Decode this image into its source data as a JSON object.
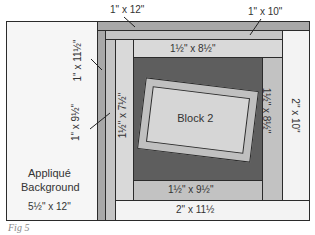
{
  "figure": {
    "caption": "Fig 5",
    "pieces": {
      "applique_background": {
        "name": "Appliqué",
        "name2": "Background",
        "size": "5½\" x 12\"",
        "color": "#f6f6f6"
      },
      "strip_1x12": {
        "size": "1\" x 12\"",
        "color": "#a8a8a8"
      },
      "strip_1x11_5": {
        "size": "1\" x 11½\"",
        "color": "#a8a8a8"
      },
      "strip_1x10": {
        "size": "1\" x 10\"",
        "color": "#c4c4c4"
      },
      "strip_1x9_5": {
        "size": "1\" x 9½\"",
        "color": "#c4c4c4"
      },
      "strip_2x10": {
        "size": "2\" x 10\"",
        "color": "#f3f3f3"
      },
      "strip_2x11_5": {
        "size": "2\" x 11½",
        "color": "#f3f3f3"
      },
      "strip_1_5x7_5": {
        "size": "1½\" x 7½\"",
        "color": "#d9d9d9"
      },
      "strip_1_5x8_5_top": {
        "size": "1½\" x 8½\"",
        "color": "#d9d9d9"
      },
      "strip_1_5x8_5_right": {
        "size": "1½\" x 8½\"",
        "color": "#c2c2c2"
      },
      "strip_1_5x9_5": {
        "size": "1½\" x 9½\"",
        "color": "#c2c2c2"
      },
      "center_background": {
        "color": "#5e5e5e"
      },
      "block2": {
        "label": "Block 2",
        "color": "#d6d6d6",
        "frame_color": "#c0c0c0"
      }
    }
  }
}
